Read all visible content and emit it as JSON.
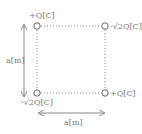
{
  "diagram": {
    "type": "point-charges-square",
    "charges": {
      "top_left": "+Q[C]",
      "top_right": "-√2Q[C]",
      "bottom_left": "-√2Q[C]",
      "bottom_right": "+Q[C]"
    },
    "dimensions": {
      "side_vertical": "a[m]",
      "side_horizontal": "a[m]"
    },
    "colors": {
      "line": "#888888",
      "text": "#777777",
      "background": "#ffffff"
    }
  }
}
